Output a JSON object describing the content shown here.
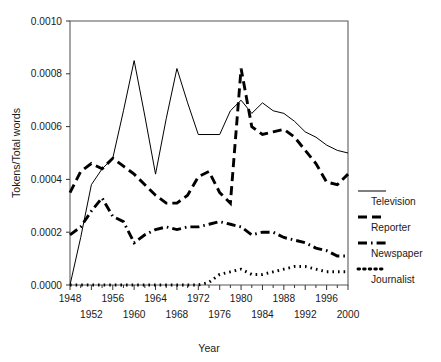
{
  "chart_data": {
    "type": "line",
    "title": "",
    "xlabel": "Year",
    "ylabel": "Tokens/Total words",
    "xlim": [
      1948,
      2000
    ],
    "ylim": [
      0.0,
      0.001
    ],
    "grid": false,
    "legend_position": "right",
    "y_ticks": [
      "0.0010",
      "0.0008",
      "0.0006",
      "0.0004",
      "0.0002",
      "0.0000"
    ],
    "y_tick_values": [
      0.001,
      0.0008,
      0.0006,
      0.0004,
      0.0002,
      0.0
    ],
    "x_ticks_upper": [
      "1948",
      "1956",
      "1964",
      "1972",
      "1980",
      "1988",
      "1996"
    ],
    "x_ticks_lower": [
      "1952",
      "1960",
      "1968",
      "1976",
      "1984",
      "1992",
      "2000"
    ],
    "x_tick_values_upper": [
      1948,
      1956,
      1964,
      1972,
      1980,
      1988,
      1996
    ],
    "x_tick_values_lower": [
      1952,
      1960,
      1968,
      1976,
      1984,
      1992,
      2000
    ],
    "x": [
      1948,
      1950,
      1952,
      1954,
      1956,
      1958,
      1960,
      1962,
      1964,
      1966,
      1968,
      1970,
      1972,
      1974,
      1976,
      1978,
      1980,
      1982,
      1984,
      1986,
      1988,
      1990,
      1992,
      1994,
      1996,
      1998,
      2000
    ],
    "series": [
      {
        "name": "Television",
        "style": "solid",
        "values": [
          0.0,
          0.00018,
          0.00038,
          0.00044,
          0.00048,
          0.00066,
          0.00085,
          0.00064,
          0.00042,
          0.00063,
          0.00082,
          0.00069,
          0.00057,
          0.00057,
          0.00057,
          0.00066,
          0.0007,
          0.00065,
          0.00069,
          0.00066,
          0.00065,
          0.00062,
          0.00058,
          0.00056,
          0.00053,
          0.00051,
          0.0005
        ]
      },
      {
        "name": "Reporter",
        "style": "dashed",
        "values": [
          0.00035,
          0.00043,
          0.00046,
          0.00044,
          0.00048,
          0.00045,
          0.00042,
          0.00038,
          0.00034,
          0.00031,
          0.00031,
          0.00034,
          0.00041,
          0.00043,
          0.00035,
          0.00031,
          0.00082,
          0.0006,
          0.00057,
          0.00058,
          0.00059,
          0.00056,
          0.00051,
          0.00046,
          0.00039,
          0.00038,
          0.00042
        ]
      },
      {
        "name": "Newspaper",
        "style": "dashdot",
        "values": [
          0.00019,
          0.00022,
          0.00028,
          0.00033,
          0.00026,
          0.00024,
          0.00016,
          0.00019,
          0.00021,
          0.00022,
          0.00021,
          0.00022,
          0.00022,
          0.00023,
          0.00024,
          0.00023,
          0.00022,
          0.00019,
          0.0002,
          0.0002,
          0.00018,
          0.00017,
          0.00016,
          0.00014,
          0.00013,
          0.00011,
          0.00011
        ]
      },
      {
        "name": "Journalist",
        "style": "dotted",
        "values": [
          0.0,
          0.0,
          0.0,
          0.0,
          0.0,
          0.0,
          0.0,
          0.0,
          0.0,
          0.0,
          0.0,
          0.0,
          0.0,
          1e-05,
          4e-05,
          5e-05,
          6e-05,
          4e-05,
          4e-05,
          5e-05,
          6e-05,
          7e-05,
          7e-05,
          6e-05,
          5e-05,
          5e-05,
          5e-05
        ]
      }
    ],
    "legend": [
      {
        "label": "Television",
        "style": "solid"
      },
      {
        "label": "Reporter",
        "style": "dashed"
      },
      {
        "label": "Newspaper",
        "style": "dashdot"
      },
      {
        "label": "Journalist",
        "style": "dotted"
      }
    ],
    "colors": {
      "line": "#000000",
      "axis": "#555555",
      "text": "#1a1a1a",
      "background": "#ffffff"
    }
  }
}
